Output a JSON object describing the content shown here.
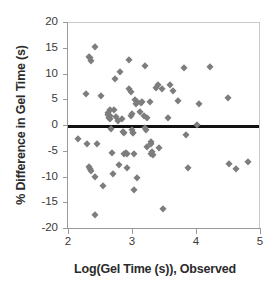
{
  "chart_data": {
    "type": "scatter",
    "title": "",
    "xlabel": "Log(Gel Time (s)), Observed",
    "ylabel": "% Difference in Gel Time (s)",
    "xlim": [
      2,
      5
    ],
    "ylim": [
      -20,
      20
    ],
    "xticks": [
      2,
      3,
      4,
      5
    ],
    "yticks": [
      -20,
      -15,
      -10,
      -5,
      0,
      5,
      10,
      15,
      20
    ],
    "xtick_labels": [
      "2",
      "3",
      "4",
      "5"
    ],
    "ytick_labels": [
      "-20",
      "-15",
      "-10",
      "-5",
      "0",
      "5",
      "10",
      "15",
      "20"
    ],
    "grid": false,
    "legend": null,
    "marker_color": "#7d7d7d",
    "marker_shape": "diamond",
    "reference_lines": [
      {
        "name": "zero-line",
        "orientation": "horizontal",
        "y": 0,
        "color": "#111111",
        "width_px": 3
      }
    ],
    "points": [
      [
        2.16,
        -2.5
      ],
      [
        2.28,
        6.3
      ],
      [
        2.3,
        -3.5
      ],
      [
        2.33,
        13.4
      ],
      [
        2.35,
        13.2
      ],
      [
        2.36,
        12.6
      ],
      [
        2.34,
        -8.4
      ],
      [
        2.36,
        -8.7
      ],
      [
        2.33,
        -8.0
      ],
      [
        2.42,
        15.3
      ],
      [
        2.42,
        -9.9
      ],
      [
        2.42,
        -17.3
      ],
      [
        2.46,
        -3.4
      ],
      [
        2.52,
        5.9
      ],
      [
        2.55,
        -11.7
      ],
      [
        2.62,
        2.6
      ],
      [
        2.63,
        2.1
      ],
      [
        2.65,
        1.9
      ],
      [
        2.66,
        1.3
      ],
      [
        2.64,
        1.6
      ],
      [
        2.66,
        3.2
      ],
      [
        2.67,
        -0.6
      ],
      [
        2.68,
        -5.3
      ],
      [
        2.7,
        -9.3
      ],
      [
        2.73,
        9.2
      ],
      [
        2.72,
        3.2
      ],
      [
        2.75,
        1.7
      ],
      [
        2.78,
        1.0
      ],
      [
        2.8,
        -7.6
      ],
      [
        2.82,
        10.4
      ],
      [
        2.85,
        1.4
      ],
      [
        2.86,
        -1.1
      ],
      [
        2.87,
        -1.4
      ],
      [
        2.88,
        -5.4
      ],
      [
        2.9,
        -5.3
      ],
      [
        2.92,
        -5.5
      ],
      [
        2.92,
        -8.1
      ],
      [
        2.96,
        12.8
      ],
      [
        2.96,
        7.1
      ],
      [
        2.98,
        6.6
      ],
      [
        2.99,
        1.9
      ],
      [
        3.0,
        2.3
      ],
      [
        3.0,
        -0.7
      ],
      [
        3.01,
        -1.3
      ],
      [
        3.02,
        -1.4
      ],
      [
        3.03,
        -5.4
      ],
      [
        3.03,
        -12.5
      ],
      [
        3.05,
        5.0
      ],
      [
        3.06,
        4.3
      ],
      [
        3.08,
        4.6
      ],
      [
        3.08,
        -10.1
      ],
      [
        3.12,
        2.8
      ],
      [
        3.14,
        4.5
      ],
      [
        3.15,
        4.7
      ],
      [
        3.18,
        1.9
      ],
      [
        3.2,
        11.7
      ],
      [
        3.21,
        -0.3
      ],
      [
        3.22,
        -0.8
      ],
      [
        3.24,
        1.5
      ],
      [
        3.24,
        -4.1
      ],
      [
        3.28,
        4.7
      ],
      [
        3.29,
        -3.1
      ],
      [
        3.3,
        -3.5
      ],
      [
        3.3,
        -5.4
      ],
      [
        3.31,
        -5.0
      ],
      [
        3.33,
        -5.6
      ],
      [
        3.38,
        7.4
      ],
      [
        3.4,
        8.0
      ],
      [
        3.42,
        -4.2
      ],
      [
        3.47,
        7.1
      ],
      [
        3.48,
        -16.1
      ],
      [
        3.56,
        1.5
      ],
      [
        3.6,
        8.0
      ],
      [
        3.64,
        6.7
      ],
      [
        3.72,
        4.9
      ],
      [
        3.82,
        11.2
      ],
      [
        3.84,
        -1.8
      ],
      [
        3.88,
        -8.1
      ],
      [
        4.02,
        0.1
      ],
      [
        4.05,
        4.2
      ],
      [
        4.22,
        11.5
      ],
      [
        4.5,
        5.5
      ],
      [
        4.52,
        -7.3
      ],
      [
        4.62,
        -8.3
      ],
      [
        4.82,
        -6.9
      ]
    ]
  }
}
